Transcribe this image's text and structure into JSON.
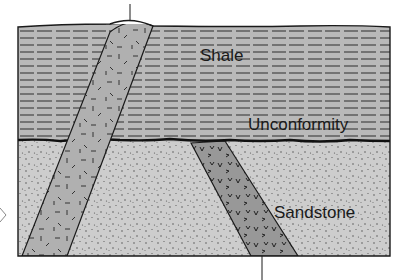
{
  "diagram": {
    "type": "geologic-cross-section",
    "labels": {
      "shale": "Shale",
      "unconformity": "Unconformity",
      "sandstone": "Sandstone"
    },
    "layers": [
      {
        "name": "shale",
        "pattern": "dashed-horizontal-lines",
        "position": "upper"
      },
      {
        "name": "sandstone",
        "pattern": "stipple-dots",
        "position": "lower"
      }
    ],
    "intrusions": [
      {
        "name": "left-dike",
        "cuts": [
          "sandstone",
          "shale",
          "unconformity"
        ],
        "pattern": "random-dashes",
        "reaches_surface": true
      },
      {
        "name": "right-dike",
        "cuts": [
          "sandstone"
        ],
        "pattern": "v-marks",
        "truncated_by": "unconformity"
      }
    ],
    "leader_lines": [
      {
        "target": "left-dike",
        "direction": "up"
      },
      {
        "target": "right-dike",
        "direction": "down"
      }
    ],
    "colors": {
      "shale": "#b9b9b9",
      "sandstone": "#cdcdcd",
      "left_dike": "#b0b0b0",
      "right_dike": "#989898",
      "outline": "#1a1a1a"
    }
  }
}
